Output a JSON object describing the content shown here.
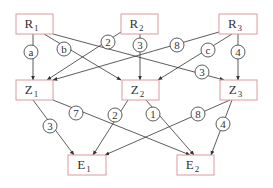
{
  "diagram": {
    "colors": {
      "node_border": "#d99aa0",
      "edge": "#333333",
      "text": "#333333",
      "background": "#ffffff"
    },
    "nodes": [
      {
        "id": "R1",
        "base": "R",
        "sub": "1",
        "x": 16,
        "y": 14,
        "w": 37,
        "h": 20
      },
      {
        "id": "R2",
        "base": "R",
        "sub": "2",
        "x": 121,
        "y": 14,
        "w": 37,
        "h": 20
      },
      {
        "id": "R3",
        "base": "R",
        "sub": "3",
        "x": 219,
        "y": 14,
        "w": 38,
        "h": 20
      },
      {
        "id": "Z1",
        "base": "Z",
        "sub": "1",
        "x": 16,
        "y": 80,
        "w": 37,
        "h": 20
      },
      {
        "id": "Z2",
        "base": "Z",
        "sub": "2",
        "x": 122,
        "y": 80,
        "w": 37,
        "h": 20
      },
      {
        "id": "Z3",
        "base": "Z",
        "sub": "3",
        "x": 220,
        "y": 80,
        "w": 37,
        "h": 20
      },
      {
        "id": "E1",
        "base": "E",
        "sub": "1",
        "x": 68,
        "y": 155,
        "w": 38,
        "h": 20
      },
      {
        "id": "E2",
        "base": "E",
        "sub": "2",
        "x": 177,
        "y": 155,
        "w": 37,
        "h": 20
      }
    ],
    "edges": [
      {
        "from": "R1",
        "to": "Z1",
        "label": "a",
        "x1": 33,
        "y1": 34,
        "x2": 33,
        "y2": 80,
        "lx": 31,
        "ly": 52
      },
      {
        "from": "R1",
        "to": "Z2",
        "label": "b",
        "x1": 44,
        "y1": 34,
        "x2": 121,
        "y2": 80,
        "lx": 64,
        "ly": 49
      },
      {
        "from": "R1",
        "to": "Z3",
        "label": "3",
        "x1": 53,
        "y1": 34,
        "x2": 224,
        "y2": 80,
        "lx": 202,
        "ly": 72
      },
      {
        "from": "R2",
        "to": "Z1",
        "label": "2",
        "x1": 121,
        "y1": 32,
        "x2": 47,
        "y2": 80,
        "lx": 108,
        "ly": 42
      },
      {
        "from": "R2",
        "to": "Z2",
        "label": "3",
        "x1": 140,
        "y1": 34,
        "x2": 140,
        "y2": 80,
        "lx": 140,
        "ly": 45
      },
      {
        "from": "R3",
        "to": "Z1",
        "label": "8",
        "x1": 219,
        "y1": 32,
        "x2": 53,
        "y2": 80,
        "lx": 177,
        "ly": 45
      },
      {
        "from": "R3",
        "to": "Z2",
        "label": "c",
        "x1": 232,
        "y1": 34,
        "x2": 158,
        "y2": 80,
        "lx": 208,
        "ly": 50
      },
      {
        "from": "R3",
        "to": "Z3",
        "label": "4",
        "x1": 238,
        "y1": 34,
        "x2": 238,
        "y2": 80,
        "lx": 238,
        "ly": 52
      },
      {
        "from": "Z1",
        "to": "E1",
        "label": "3",
        "x1": 33,
        "y1": 100,
        "x2": 74,
        "y2": 155,
        "lx": 50,
        "ly": 126
      },
      {
        "from": "Z1",
        "to": "E2",
        "label": "7",
        "x1": 53,
        "y1": 100,
        "x2": 190,
        "y2": 155,
        "lx": 76,
        "ly": 113
      },
      {
        "from": "Z2",
        "to": "E1",
        "label": "2",
        "x1": 128,
        "y1": 100,
        "x2": 93,
        "y2": 155,
        "lx": 115,
        "ly": 115
      },
      {
        "from": "Z2",
        "to": "E2",
        "label": "1",
        "x1": 146,
        "y1": 100,
        "x2": 194,
        "y2": 155,
        "lx": 153,
        "ly": 114
      },
      {
        "from": "Z3",
        "to": "E1",
        "label": "8",
        "x1": 230,
        "y1": 100,
        "x2": 105,
        "y2": 155,
        "lx": 198,
        "ly": 114
      },
      {
        "from": "Z3",
        "to": "E2",
        "label": "4",
        "x1": 232,
        "y1": 100,
        "x2": 211,
        "y2": 155,
        "lx": 223,
        "ly": 124
      }
    ]
  }
}
